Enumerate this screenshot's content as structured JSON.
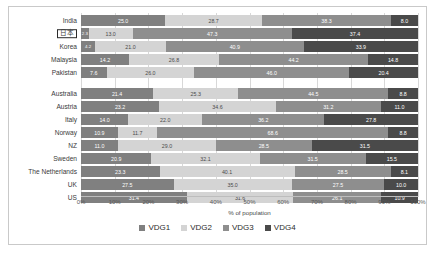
{
  "chart_data": {
    "type": "bar",
    "orientation": "horizontal",
    "stacked": true,
    "stack_mode": "percent",
    "title": "",
    "xlabel": "% of population",
    "ylabel": "",
    "xlim": [
      0,
      100
    ],
    "xticks": [
      "0%",
      "10%",
      "20%",
      "30%",
      "40%",
      "50%",
      "60%",
      "70%",
      "80%",
      "90%",
      "100%"
    ],
    "grid": true,
    "legend_position": "bottom",
    "legend": [
      "VDG1",
      "VDG2",
      "VDG3",
      "VDG4"
    ],
    "colors": {
      "VDG1": "#808080",
      "VDG2": "#d4d4d4",
      "VDG3": "#8e8e8e",
      "VDG4": "#4a4a4a"
    },
    "categories": [
      "India",
      "日本",
      "Korea",
      "Malaysia",
      "Pakistan",
      "Australia",
      "Austria",
      "Italy",
      "Norway",
      "NZ",
      "Sweden",
      "The Netherlands",
      "UK",
      "US"
    ],
    "highlighted_category": "日本",
    "group_break_after": "Pakistan",
    "series": [
      {
        "name": "VDG1",
        "values": [
          25.0,
          2.3,
          4.2,
          14.2,
          7.6,
          21.4,
          23.2,
          14.0,
          10.9,
          11.0,
          20.9,
          23.3,
          27.5,
          31.4
        ]
      },
      {
        "name": "VDG2",
        "values": [
          28.7,
          13.0,
          21.0,
          26.8,
          26.0,
          25.3,
          34.6,
          22.0,
          11.7,
          29.0,
          32.1,
          40.1,
          35.0,
          31.6
        ]
      },
      {
        "name": "VDG3",
        "values": [
          38.3,
          47.3,
          40.9,
          44.2,
          46.0,
          44.5,
          31.2,
          36.2,
          68.6,
          28.5,
          31.5,
          28.5,
          27.5,
          26.1
        ]
      },
      {
        "name": "VDG4",
        "values": [
          8.0,
          37.4,
          33.9,
          14.8,
          20.4,
          8.8,
          11.0,
          27.8,
          8.8,
          31.5,
          15.5,
          8.1,
          10.0,
          10.9
        ]
      }
    ],
    "rows": [
      {
        "category": "India",
        "VDG1": "25.0",
        "VDG2": "28.7",
        "VDG3": "38.3",
        "VDG4": "8.0"
      },
      {
        "category": "日本",
        "VDG1": "2.3",
        "VDG2": "13.0",
        "VDG3": "47.3",
        "VDG4": "37.4"
      },
      {
        "category": "Korea",
        "VDG1": "4.2",
        "VDG2": "21.0",
        "VDG3": "40.9",
        "VDG4": "33.9"
      },
      {
        "category": "Malaysia",
        "VDG1": "14.2",
        "VDG2": "26.8",
        "VDG3": "44.2",
        "VDG4": "14.8"
      },
      {
        "category": "Pakistan",
        "VDG1": "7.6",
        "VDG2": "26.0",
        "VDG3": "46.0",
        "VDG4": "20.4"
      },
      {
        "category": "Australia",
        "VDG1": "21.4",
        "VDG2": "25.3",
        "VDG3": "44.5",
        "VDG4": "8.8"
      },
      {
        "category": "Austria",
        "VDG1": "23.2",
        "VDG2": "34.6",
        "VDG3": "31.2",
        "VDG4": "11.0"
      },
      {
        "category": "Italy",
        "VDG1": "14.0",
        "VDG2": "22.0",
        "VDG3": "36.2",
        "VDG4": "27.8"
      },
      {
        "category": "Norway",
        "VDG1": "10.9",
        "VDG2": "11.7",
        "VDG3": "68.6",
        "VDG4": "8.8"
      },
      {
        "category": "NZ",
        "VDG1": "11.0",
        "VDG2": "29.0",
        "VDG3": "28.5",
        "VDG4": "31.5"
      },
      {
        "category": "Sweden",
        "VDG1": "20.9",
        "VDG2": "32.1",
        "VDG3": "31.5",
        "VDG4": "15.5"
      },
      {
        "category": "The Netherlands",
        "VDG1": "23.3",
        "VDG2": "40.1",
        "VDG3": "28.5",
        "VDG4": "8.1"
      },
      {
        "category": "UK",
        "VDG1": "27.5",
        "VDG2": "35.0",
        "VDG3": "27.5",
        "VDG4": "10.0"
      },
      {
        "category": "US",
        "VDG1": "31.4",
        "VDG2": "31.6",
        "VDG3": "26.1",
        "VDG4": "10.9"
      }
    ]
  }
}
